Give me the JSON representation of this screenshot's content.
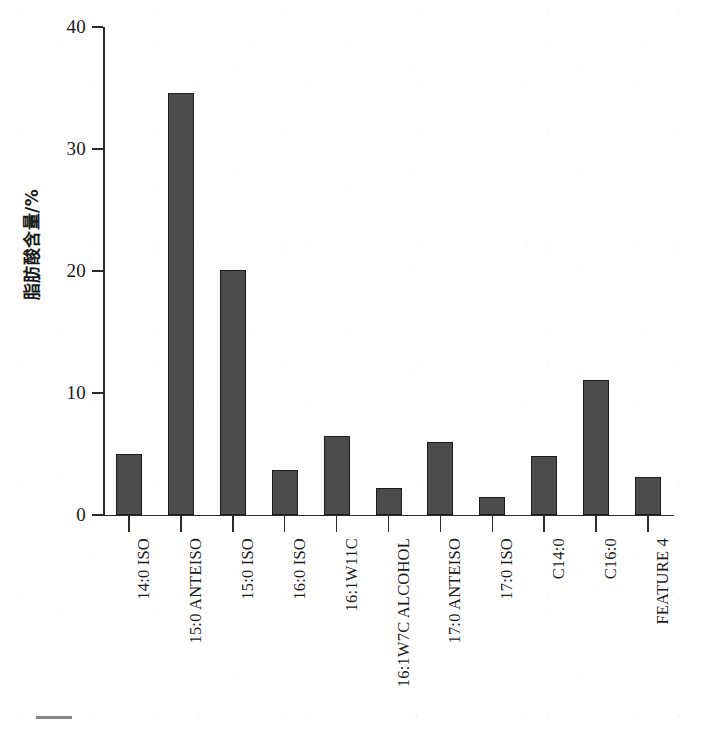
{
  "chart_data": {
    "type": "bar",
    "title": "",
    "subtitle": "",
    "xlabel": "",
    "ylabel": "脂肪酸含量/%",
    "ylim": [
      0,
      40
    ],
    "yticks": [
      0,
      10,
      20,
      30,
      40
    ],
    "grid": false,
    "legend": false,
    "legend_position": "none",
    "bar_color": "#4c4c4c",
    "bar_edge_color": "#1c1c1c",
    "axis_color": "#2b2b2b",
    "background_color": "#ffffff",
    "categories": [
      "14:0 ISO",
      "15:0 ANTEISO",
      "15:0 ISO",
      "16:0 ISO",
      "16:1W11C",
      "16:1W7C ALCOHOL",
      "17:0 ANTEISO",
      "17:0 ISO",
      "C14:0",
      "C16:0",
      "FEATURE 4"
    ],
    "values": [
      5.0,
      34.6,
      20.1,
      3.7,
      6.5,
      2.2,
      6.0,
      1.5,
      4.8,
      11.1,
      3.1
    ],
    "units": "%"
  },
  "axes": {
    "y_title": "脂肪酸含量/%",
    "y_tick_labels": [
      "40",
      "30",
      "20",
      "10",
      "0"
    ]
  }
}
